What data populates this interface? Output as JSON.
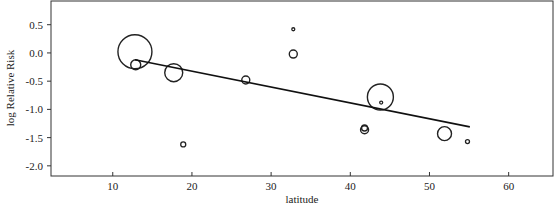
{
  "chart_data": {
    "type": "scatter",
    "title": "",
    "xlabel": "latitude",
    "ylabel": "log Relative Risk",
    "xlim": [
      2.2,
      65.6
    ],
    "ylim": [
      -2.18,
      0.92
    ],
    "xticks": [
      10,
      20,
      30,
      40,
      50,
      60
    ],
    "yticks": [
      0.5,
      0.0,
      -0.5,
      -1.0,
      -1.5,
      -2.0
    ],
    "xtick_labels": [
      "10",
      "20",
      "30",
      "40",
      "50",
      "60"
    ],
    "ytick_labels": [
      "0.5",
      "0.0",
      "-0.5",
      "-1.0",
      "-1.5",
      "-2.0"
    ],
    "grid": false,
    "legend": null,
    "marker": "open circle, size proportional to study weight",
    "points": [
      {
        "x": 12.8,
        "y": 0.02,
        "size": 17
      },
      {
        "x": 12.9,
        "y": -0.21,
        "size": 5
      },
      {
        "x": 17.7,
        "y": -0.35,
        "size": 9
      },
      {
        "x": 18.9,
        "y": -1.62,
        "size": 2.5
      },
      {
        "x": 26.8,
        "y": -0.48,
        "size": 4
      },
      {
        "x": 32.8,
        "y": 0.42,
        "size": 1.5
      },
      {
        "x": 32.8,
        "y": -0.02,
        "size": 4
      },
      {
        "x": 41.8,
        "y": -1.36,
        "size": 4
      },
      {
        "x": 41.8,
        "y": -1.33,
        "size": 3
      },
      {
        "x": 43.8,
        "y": -0.78,
        "size": 13
      },
      {
        "x": 43.9,
        "y": -0.88,
        "size": 1.5
      },
      {
        "x": 51.9,
        "y": -1.43,
        "size": 7
      },
      {
        "x": 54.8,
        "y": -1.57,
        "size": 2
      }
    ],
    "regression_line": {
      "x": [
        12.8,
        55.1
      ],
      "y": [
        -0.12,
        -1.31
      ]
    }
  }
}
